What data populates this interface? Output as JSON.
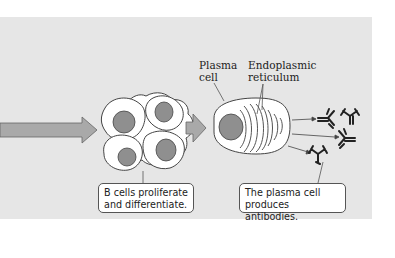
{
  "labels": {
    "plasma_cell": "Plasma\ncell",
    "endoplasmic_reticulum": "Endoplasmic\nreticulum"
  },
  "callouts": {
    "b_cells": "B cells proliferate\nand differentiate.",
    "plasma_cell": "The plasma cell\nproduces antibodies."
  },
  "colors": {
    "background_panel": "#e6e6e6",
    "arrow_fill": "#a9a9a9",
    "nucleus_fill": "#8f8f8f",
    "cell_fill": "#ffffff",
    "outline": "#444444"
  }
}
